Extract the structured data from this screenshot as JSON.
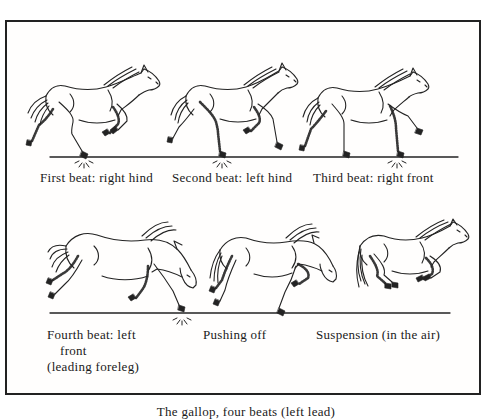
{
  "page": {
    "background": "#ffffff",
    "ink_color": "#232323",
    "frame_border_color": "#222222"
  },
  "captions": {
    "row1": [
      "First beat: right hind",
      "Second beat: left hind",
      "Third beat: right front"
    ],
    "row2_beat4_lines": [
      "Fourth beat: left",
      "front",
      "(leading foreleg)"
    ],
    "row2": [
      "Pushing off",
      "Suspension (in the air)"
    ],
    "bottom": "The gallop, four beats (left lead)"
  },
  "illustrations": [
    "horse-first-beat-right-hind",
    "horse-second-beat-left-hind",
    "horse-third-beat-right-front",
    "horse-fourth-beat-left-front",
    "horse-pushing-off",
    "horse-suspension-in-air"
  ],
  "marks": {
    "ground_lines": 2,
    "hoof_impact_sparkles": 4
  }
}
